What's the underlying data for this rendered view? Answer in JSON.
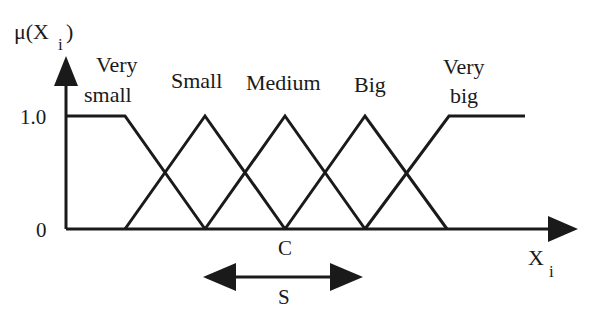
{
  "diagram": {
    "type": "fuzzy-membership-functions",
    "y_axis": {
      "label": "μ(X",
      "label_sub": "i",
      "label_close": ")",
      "ticks": [
        "1.0",
        "0"
      ]
    },
    "x_axis": {
      "label": "X",
      "label_sub": "i"
    },
    "center_label": "C",
    "spread_label": "S",
    "sets": [
      {
        "name": "very-small",
        "line1": "Very",
        "line2": "small"
      },
      {
        "name": "small",
        "line1": "Small"
      },
      {
        "name": "medium",
        "line1": "Medium"
      },
      {
        "name": "big",
        "line1": "Big"
      },
      {
        "name": "very-big",
        "line1": "Very",
        "line2": "big"
      }
    ],
    "line_color": "#1a1a1a"
  }
}
